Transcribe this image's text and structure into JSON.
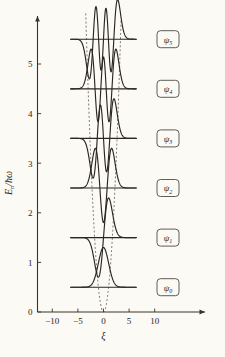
{
  "figure": {
    "title": "",
    "background_color": "#fbfaf4",
    "curve_color": "#2b2620",
    "potential_color": "#6b645a"
  },
  "axes": {
    "x": {
      "label": "ξ",
      "ticks": [
        -10,
        -5,
        0,
        5,
        10
      ],
      "tick_labels": [
        "−10",
        "−5",
        "0",
        "5",
        "10"
      ],
      "range": [
        -13.2,
        14.8
      ]
    },
    "y": {
      "label_parts": {
        "E": "E",
        "n": "n",
        "slash": "/",
        "hbar": "ħ",
        "omega": "ω"
      },
      "label": "Eₙ/ħω",
      "ticks": [
        0,
        1,
        2,
        3,
        4,
        5
      ],
      "tick_labels": [
        "0",
        "1",
        "2",
        "3",
        "4",
        "5"
      ],
      "range": [
        0,
        6.05
      ]
    }
  },
  "chart_data": {
    "type": "line",
    "title": "",
    "xlabel": "ξ",
    "ylabel": "Eₙ/ħω",
    "xlim": [
      -13.2,
      14.8
    ],
    "ylim": [
      0,
      6.05
    ],
    "grid": false,
    "legend": "inline-boxed-right",
    "series": [
      {
        "name": "ψ₀",
        "n": 0,
        "energy": 0.5,
        "nodes": 0,
        "parity": "even",
        "amplitude": 0.8,
        "domain": [
          -6.4,
          6.4
        ]
      },
      {
        "name": "ψ₁",
        "n": 1,
        "energy": 1.5,
        "nodes": 1,
        "parity": "odd",
        "amplitude": 0.8,
        "domain": [
          -6.4,
          6.4
        ]
      },
      {
        "name": "ψ₂",
        "n": 2,
        "energy": 2.5,
        "nodes": 2,
        "parity": "even",
        "amplitude": 0.8,
        "domain": [
          -6.4,
          6.4
        ]
      },
      {
        "name": "ψ₃",
        "n": 3,
        "energy": 3.5,
        "nodes": 3,
        "parity": "odd",
        "amplitude": 0.8,
        "domain": [
          -6.4,
          6.4
        ]
      },
      {
        "name": "ψ₄",
        "n": 4,
        "energy": 4.5,
        "nodes": 4,
        "parity": "even",
        "amplitude": 0.8,
        "domain": [
          -6.4,
          6.4
        ]
      },
      {
        "name": "ψ₅",
        "n": 5,
        "energy": 5.5,
        "nodes": 5,
        "parity": "odd",
        "amplitude": 0.8,
        "domain": [
          -6.4,
          6.4
        ]
      }
    ],
    "potential": {
      "name": "V(ξ) = ξ²/2",
      "style": "dashed",
      "points_xi": [
        -3.45,
        -3.0,
        -2.5,
        -2.0,
        -1.5,
        -1.0,
        -0.5,
        0,
        0.5,
        1.0,
        1.5,
        2.0,
        2.5,
        3.0,
        3.45
      ],
      "points_E": [
        5.95,
        4.5,
        3.125,
        2.0,
        1.125,
        0.5,
        0.125,
        0,
        0.125,
        0.5,
        1.125,
        2.0,
        3.125,
        4.5,
        5.95
      ]
    }
  },
  "labels": {
    "boxed": [
      {
        "symbol": "ψ",
        "subscript": "5",
        "energy": 5.5
      },
      {
        "symbol": "ψ",
        "subscript": "4",
        "energy": 4.5
      },
      {
        "symbol": "ψ",
        "subscript": "3",
        "energy": 3.5
      },
      {
        "symbol": "ψ",
        "subscript": "2",
        "energy": 2.5
      },
      {
        "symbol": "ψ",
        "subscript": "1",
        "energy": 1.5
      },
      {
        "symbol": "ψ",
        "subscript": "0",
        "energy": 0.5
      }
    ]
  }
}
